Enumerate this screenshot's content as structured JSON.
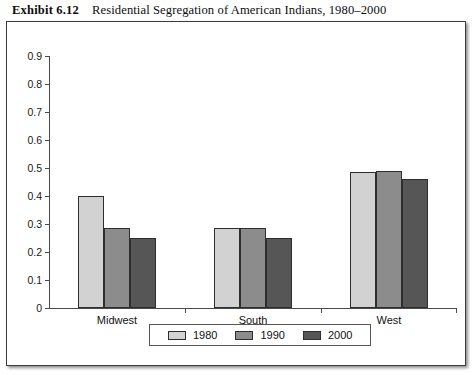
{
  "caption": {
    "label": "Exhibit 6.12",
    "text": "Residential Segregation of American Indians, 1980–2000"
  },
  "chart_data": {
    "type": "bar",
    "title": "Residential Segregation of American Indians, 1980–2000",
    "xlabel": "",
    "ylabel": "",
    "categories": [
      "Midwest",
      "South",
      "West"
    ],
    "series": [
      {
        "name": "1980",
        "values": [
          0.4,
          0.285,
          0.485
        ],
        "color": "#d2d2d2"
      },
      {
        "name": "1990",
        "values": [
          0.285,
          0.285,
          0.49
        ],
        "color": "#8c8c8c"
      },
      {
        "name": "2000",
        "values": [
          0.25,
          0.25,
          0.46
        ],
        "color": "#565656"
      }
    ],
    "ylim": [
      0,
      0.9
    ],
    "ytick_values": [
      0,
      0.1,
      0.2,
      0.3,
      0.4,
      0.5,
      0.6,
      0.7,
      0.8,
      0.9
    ],
    "ytick_labels": [
      "0",
      "0.1",
      "0.2",
      "0.3",
      "0.4",
      "0.5",
      "0.6",
      "0.7",
      "0.8",
      "0.9"
    ],
    "grid": false,
    "legend_position": "bottom",
    "legend_entries": [
      "1980",
      "1990",
      "2000"
    ]
  }
}
